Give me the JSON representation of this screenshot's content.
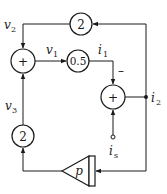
{
  "diagram": {
    "type": "signal-flow block diagram",
    "blocks": {
      "gain_top": {
        "label": "2"
      },
      "summer_left": {
        "label": "+"
      },
      "gain_mid": {
        "label": "0.5"
      },
      "summer_right": {
        "label": "+"
      },
      "gain_bottom": {
        "label": "2"
      },
      "amplifier": {
        "label": "p"
      }
    },
    "signals": {
      "v2": {
        "base": "v",
        "sub": "2"
      },
      "v1": {
        "base": "v",
        "sub": "1"
      },
      "v3": {
        "base": "v",
        "sub": "3"
      },
      "i1": {
        "base": "i",
        "sub": "1"
      },
      "i2": {
        "base": "i",
        "sub": "2"
      },
      "is": {
        "base": "i",
        "sub": "s"
      }
    },
    "signs": {
      "i1_into_summer_right": "–"
    },
    "colors": {
      "stroke": "#1a1a1a",
      "background": "#ffffff"
    }
  }
}
